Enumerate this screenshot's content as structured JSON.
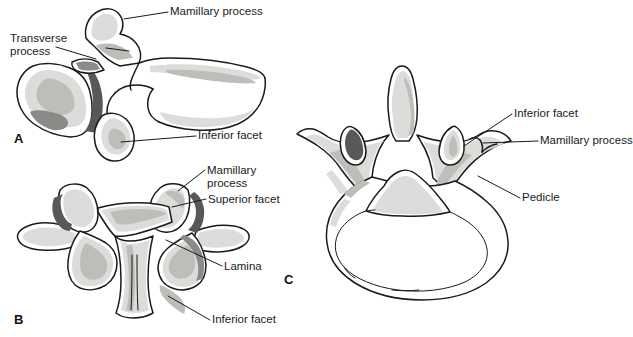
{
  "figure": {
    "background_color": "#ffffff",
    "outline_color": "#1a1a1a",
    "shading_light": "#d8d8d6",
    "shading_mid": "#b8b8b4",
    "shading_dark": "#6e6e6c",
    "width": 622,
    "height": 337
  },
  "panels": [
    {
      "letter": "A",
      "view": "lateral-view",
      "x": 14,
      "y": 131
    },
    {
      "letter": "B",
      "view": "posterior-view",
      "x": 14,
      "y": 312
    },
    {
      "letter": "C",
      "view": "superior-axial-view",
      "x": 284,
      "y": 272
    }
  ],
  "labels": {
    "a_mamillary_process": "Mamillary process",
    "a_transverse_process_line1": "Transverse",
    "a_transverse_process_line2": "process",
    "a_inferior_facet": "Inferior facet",
    "b_mamillary_process_line1": "Mamillary",
    "b_mamillary_process_line2": "process",
    "b_superior_facet": "Superior facet",
    "b_lamina": "Lamina",
    "b_inferior_facet": "Inferior facet",
    "c_inferior_facet": "Inferior facet",
    "c_mamillary_process": "Mamillary process",
    "c_pedicle": "Pedicle"
  }
}
